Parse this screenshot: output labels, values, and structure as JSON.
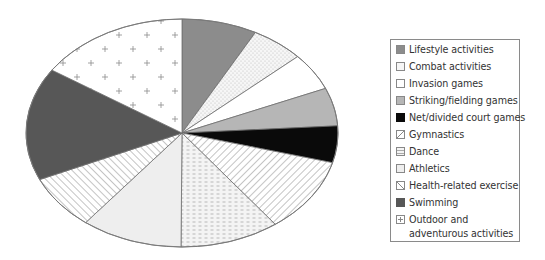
{
  "chart_data": {
    "type": "pie",
    "title": "",
    "style": "elliptical pie (perspective), greyscale patterns, clockwise from 12 o'clock",
    "legend_position": "right",
    "slices": [
      {
        "label": "Lifestyle activities",
        "value": 7.8,
        "fill": "#8c8c8c",
        "pattern": "solid"
      },
      {
        "label": "Combat activities",
        "value": 5.5,
        "fill": "#f4f4f4",
        "pattern": "dots"
      },
      {
        "label": "Invasion games",
        "value": 5.3,
        "fill": "#ffffff",
        "pattern": "none"
      },
      {
        "label": "Striking/fielding games",
        "value": 5.4,
        "fill": "#b6b6b6",
        "pattern": "solid"
      },
      {
        "label": "Net/divided court games",
        "value": 5.2,
        "fill": "#0a0a0a",
        "pattern": "solid"
      },
      {
        "label": "Gymnastics",
        "value": 10.6,
        "fill": "#ffffff",
        "pattern": "diagonal-up"
      },
      {
        "label": "Dance",
        "value": 10.3,
        "fill": "#f2f2f2",
        "pattern": "dashes"
      },
      {
        "label": "Athletics",
        "value": 10.5,
        "fill": "#eeeeee",
        "pattern": "solid"
      },
      {
        "label": "Health-related exercise",
        "value": 7.7,
        "fill": "#ffffff",
        "pattern": "diagonal-down"
      },
      {
        "label": "Swimming",
        "value": 16.0,
        "fill": "#575757",
        "pattern": "solid"
      },
      {
        "label": "Outdoor and adventurous activities",
        "value": 15.7,
        "fill": "#ffffff",
        "pattern": "plus"
      }
    ]
  },
  "legend": {
    "items": [
      {
        "label": "Lifestyle activities"
      },
      {
        "label": "Combat activities"
      },
      {
        "label": "Invasion games"
      },
      {
        "label": "Striking/fielding games"
      },
      {
        "label": "Net/divided court games"
      },
      {
        "label": "Gymnastics"
      },
      {
        "label": "Dance"
      },
      {
        "label": "Athletics"
      },
      {
        "label": "Health-related exercise"
      },
      {
        "label": "Swimming"
      },
      {
        "label": "Outdoor and",
        "label2": "adventurous activities"
      }
    ]
  }
}
